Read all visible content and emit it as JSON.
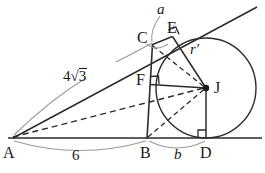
{
  "figure": {
    "kind": "geometry-diagram",
    "stroke_color": "#2b2b2b",
    "faint_color": "#8c8c8c",
    "background": "#ffffff"
  },
  "points": [
    {
      "id": "A",
      "label": "A",
      "x": 13,
      "y": 138
    },
    {
      "id": "B",
      "label": "B",
      "x": 147,
      "y": 138
    },
    {
      "id": "C",
      "label": "C",
      "x": 152,
      "y": 45
    },
    {
      "id": "D",
      "label": "D",
      "x": 206,
      "y": 138
    },
    {
      "id": "E",
      "label": "E",
      "x": 172,
      "y": 35
    },
    {
      "id": "F",
      "label": "F",
      "x": 149,
      "y": 84
    },
    {
      "id": "J",
      "label": "J",
      "x": 206,
      "y": 88
    }
  ],
  "labels": {
    "A": "A",
    "B": "B",
    "C": "C",
    "D": "D",
    "E": "E",
    "F": "F",
    "J": "J",
    "a": "a",
    "b": "b",
    "r_prime": "r′",
    "four_root_three_coef": "4",
    "four_root_three_radicand": "3",
    "sqrt_glyph": "√",
    "six": "6"
  },
  "measurements": [
    {
      "name": "AB",
      "label": "6",
      "from": "A",
      "to": "B",
      "position": "below-baseline"
    },
    {
      "name": "BD",
      "label": "b",
      "from": "B",
      "to": "D",
      "position": "below-baseline"
    },
    {
      "name": "AC",
      "label": "4√3",
      "from": "A",
      "to": "C",
      "position": "above-segment"
    },
    {
      "name": "JE",
      "label": "r′",
      "from": "J",
      "to": "E",
      "position": "along-radius"
    },
    {
      "name": "arcCE",
      "label": "a",
      "from": "C",
      "to": "E",
      "position": "top-arc"
    }
  ],
  "circle": {
    "center_point": "J",
    "cx": 206,
    "cy": 88,
    "r": 50,
    "tangent_at": [
      "D",
      "E",
      "F"
    ]
  },
  "right_angles": [
    {
      "at": "D",
      "between": [
        "J",
        "baseline"
      ]
    },
    {
      "at": "E",
      "between": [
        "J",
        "tangent-line"
      ]
    },
    {
      "at": "F",
      "between": [
        "J",
        "line-BC"
      ]
    }
  ],
  "segments": [
    {
      "name": "baseline",
      "from": "A",
      "to": "right-edge",
      "style": "solid"
    },
    {
      "name": "tangent-AE",
      "from": "A",
      "to": "upper-right",
      "style": "solid"
    },
    {
      "name": "segment-BC",
      "from": "B",
      "to": "C",
      "style": "solid"
    },
    {
      "name": "segment-JD",
      "from": "J",
      "to": "D",
      "style": "solid"
    },
    {
      "name": "segment-JE",
      "from": "J",
      "to": "E",
      "style": "solid"
    },
    {
      "name": "segment-JF",
      "from": "J",
      "to": "F",
      "style": "solid"
    },
    {
      "name": "segment-CE",
      "from": "C",
      "to": "E",
      "style": "solid"
    },
    {
      "name": "segment-AJ",
      "from": "A",
      "to": "J",
      "style": "dashed"
    },
    {
      "name": "segment-CJ",
      "from": "C",
      "to": "J",
      "style": "dashed"
    },
    {
      "name": "segment-BJ",
      "from": "B",
      "to": "J",
      "style": "dashed"
    }
  ]
}
